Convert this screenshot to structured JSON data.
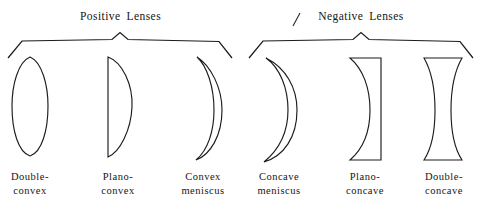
{
  "figure": {
    "title_caption": "",
    "background_color": "#ffffff",
    "ink_color": "#1c1c1c",
    "groups": [
      {
        "id": "positive-lenses",
        "title": "Positive  Lenses",
        "bracket": {
          "left_end_x": 8,
          "right_end_x": 232,
          "baseline_y": 40,
          "peak_y": 33,
          "end_drop_y": 58,
          "peak_x": 120
        },
        "lenses": [
          {
            "id": "double-convex",
            "label_line1": "Double-",
            "label_line2": "convex",
            "shape": "biconvex",
            "center_x": 30,
            "top_y": 57,
            "bottom_y": 156,
            "half_width": 18
          },
          {
            "id": "plano-convex",
            "label_line1": "Plano-",
            "label_line2": "convex",
            "shape": "plano-convex",
            "flat_x": 108,
            "top_y": 57,
            "bottom_y": 157,
            "bulge_x": 133
          },
          {
            "id": "convex-meniscus",
            "label_line1": "Convex",
            "label_line2": "meniscus",
            "shape": "convex-meniscus",
            "top_y": 57,
            "bottom_y": 160,
            "left_x": 195,
            "right_x": 222
          }
        ]
      },
      {
        "id": "negative-lenses",
        "title": "Negative  Lenses",
        "bracket": {
          "left_end_x": 249,
          "right_end_x": 473,
          "baseline_y": 40,
          "peak_y": 33,
          "end_drop_y": 58,
          "peak_x": 361
        },
        "lenses": [
          {
            "id": "concave-meniscus",
            "label_line1": "Concave",
            "label_line2": "meniscus",
            "shape": "concave-meniscus",
            "top_y": 58,
            "bottom_y": 162,
            "left_x": 263,
            "right_x": 297
          },
          {
            "id": "plano-concave",
            "label_line1": "Plano-",
            "label_line2": "concave",
            "shape": "plano-concave",
            "top_y": 58,
            "bottom_y": 160,
            "left_x": 349,
            "flat_x": 381
          },
          {
            "id": "double-concave",
            "label_line1": "Double-",
            "label_line2": "concave",
            "shape": "biconcave",
            "top_y": 58,
            "bottom_y": 160,
            "left_x": 424,
            "right_x": 462,
            "waist_inset": 9
          }
        ]
      }
    ],
    "stray_mark": {
      "name": "stray-tick-mark",
      "x1": 300,
      "y1": 13,
      "x2": 293,
      "y2": 26
    }
  }
}
